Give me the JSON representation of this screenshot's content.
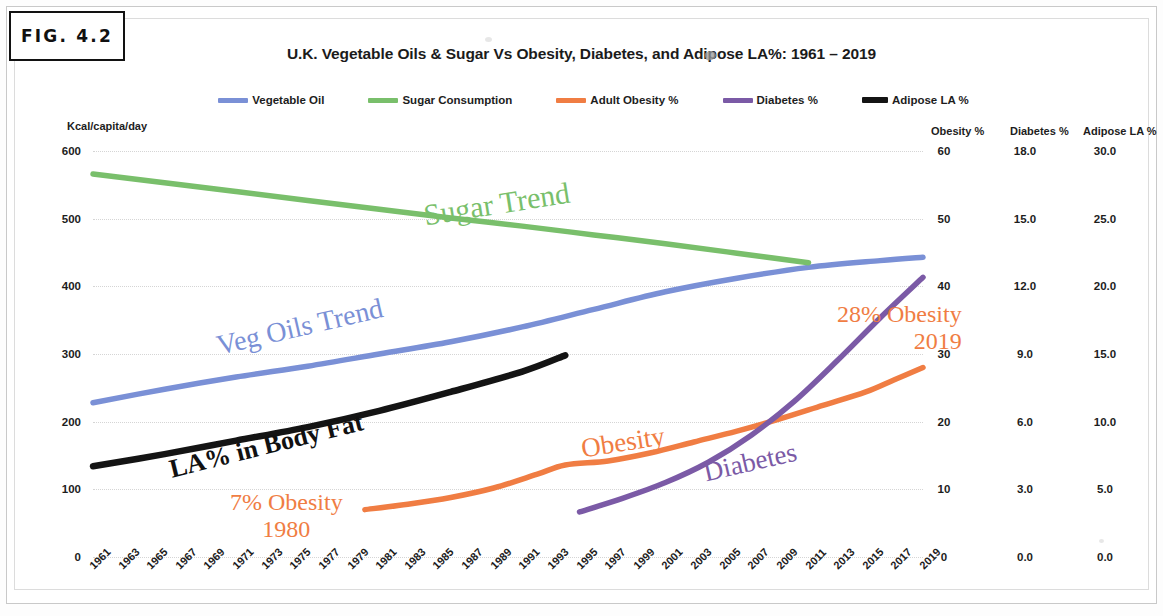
{
  "figure": {
    "label": "FIG. 4.2"
  },
  "chart_data": {
    "type": "line",
    "title": "U.K. Vegetable Oils & Sugar Vs Obesity, Diabetes, and Adipose LA%: 1961 – 2019",
    "xlabel": "",
    "x_tick_labels": [
      "1961",
      "1963",
      "1965",
      "1967",
      "1969",
      "1971",
      "1973",
      "1975",
      "1977",
      "1979",
      "1981",
      "1983",
      "1985",
      "1987",
      "1989",
      "1991",
      "1993",
      "1995",
      "1997",
      "1999",
      "2001",
      "2003",
      "2005",
      "2007",
      "2009",
      "2011",
      "2013",
      "2015",
      "2017",
      "2019"
    ],
    "xlim": [
      1961,
      2019
    ],
    "grid": true,
    "legend_position": "top-center",
    "axes": [
      {
        "id": "left",
        "label": "Kcal/capita/day",
        "ticks": [
          "600",
          "500",
          "400",
          "300",
          "200",
          "100",
          "0"
        ],
        "lim": [
          0,
          600
        ],
        "side": "left"
      },
      {
        "id": "obesity",
        "label": "Obesity %",
        "ticks": [
          "60",
          "50",
          "40",
          "30",
          "20",
          "10",
          "0"
        ],
        "lim": [
          0,
          60
        ],
        "side": "right"
      },
      {
        "id": "diabetes",
        "label": "Diabetes %",
        "ticks": [
          "18.0",
          "15.0",
          "12.0",
          "9.0",
          "6.0",
          "3.0",
          "0.0"
        ],
        "lim": [
          0,
          18
        ],
        "side": "right"
      },
      {
        "id": "adipose",
        "label": "Adipose LA %",
        "ticks": [
          "30.0",
          "25.0",
          "20.0",
          "15.0",
          "10.0",
          "5.0",
          "0.0"
        ],
        "lim": [
          0,
          30
        ],
        "side": "right"
      }
    ],
    "series": [
      {
        "name": "Vegetable Oil",
        "color": "#7a90d6",
        "axis": "left",
        "unit": "Kcal/capita/day",
        "x": [
          1961,
          1966,
          1971,
          1976,
          1981,
          1986,
          1991,
          1996,
          2001,
          2006,
          2011,
          2016,
          2019
        ],
        "values": [
          228,
          248,
          266,
          282,
          300,
          318,
          340,
          366,
          392,
          412,
          428,
          438,
          443
        ]
      },
      {
        "name": "Sugar Consumption",
        "color": "#79bf6b",
        "axis": "left",
        "unit": "Kcal/capita/day",
        "x": [
          1961,
          1966,
          1971,
          1976,
          1981,
          1986,
          1991,
          1996,
          2001,
          2006,
          2011
        ],
        "values": [
          566,
          553,
          540,
          527,
          514,
          501,
          489,
          476,
          463,
          449,
          435
        ]
      },
      {
        "name": "Adult Obesity %",
        "color": "#f07d43",
        "axis": "obesity",
        "unit": "%",
        "x": [
          1980,
          1983,
          1986,
          1989,
          1992,
          1994,
          1997,
          2000,
          2003,
          2006,
          2009,
          2012,
          2015,
          2017,
          2019
        ],
        "values": [
          7.0,
          7.8,
          8.8,
          10.2,
          12.2,
          13.6,
          14.2,
          15.4,
          17.0,
          18.6,
          20.4,
          22.4,
          24.4,
          26.2,
          28.0
        ]
      },
      {
        "name": "Diabetes %",
        "color": "#7b5aa6",
        "axis": "diabetes",
        "unit": "%",
        "x": [
          1995,
          1998,
          2001,
          2004,
          2007,
          2010,
          2013,
          2016,
          2019
        ],
        "values": [
          2.0,
          2.6,
          3.3,
          4.2,
          5.4,
          6.9,
          8.7,
          10.6,
          12.4
        ]
      },
      {
        "name": "Adipose LA %",
        "color": "#141414",
        "axis": "adipose",
        "unit": "%",
        "x": [
          1961,
          1966,
          1971,
          1976,
          1981,
          1986,
          1991,
          1994
        ],
        "values": [
          6.7,
          7.6,
          8.6,
          9.6,
          10.8,
          12.2,
          13.7,
          14.9
        ]
      }
    ],
    "annotations": [
      {
        "id": "sugar-trend",
        "text": "Sugar Trend",
        "color": "#79bf6b"
      },
      {
        "id": "veg-oils-trend",
        "text": "Veg Oils Trend",
        "color": "#7a90d6"
      },
      {
        "id": "la-body-fat",
        "text": "LA% in Body Fat",
        "color": "#111111"
      },
      {
        "id": "obesity",
        "text": "Obesity",
        "color": "#f07d43"
      },
      {
        "id": "diabetes",
        "text": "Diabetes",
        "color": "#7b5aa6"
      },
      {
        "id": "obesity-start",
        "line1": "7% Obesity",
        "line2": "1980",
        "color": "#f07d43"
      },
      {
        "id": "obesity-end",
        "line1": "28% Obesity",
        "line2": "2019",
        "color": "#f07d43"
      }
    ]
  },
  "legend": {
    "items": [
      {
        "label": "Vegetable Oil",
        "color": "#7a90d6"
      },
      {
        "label": "Sugar Consumption",
        "color": "#79bf6b"
      },
      {
        "label": "Adult Obesity %",
        "color": "#f07d43"
      },
      {
        "label": "Diabetes %",
        "color": "#7b5aa6"
      },
      {
        "label": "Adipose LA %",
        "color": "#141414"
      }
    ]
  }
}
